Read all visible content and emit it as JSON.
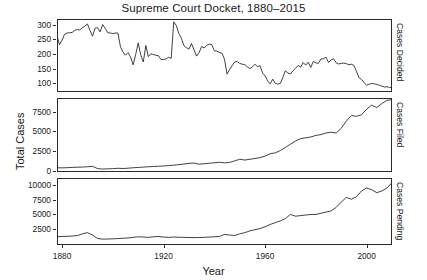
{
  "chart_data": {
    "type": "line",
    "title": "Supreme Court Docket, 1880–2015",
    "xlabel": "Year",
    "ylabel": "Total Cases",
    "grid": false,
    "legend": "none",
    "xlim": [
      1878,
      2010
    ],
    "xticks": [
      1880,
      1920,
      1960,
      2000
    ],
    "xtick_labels": [
      "1880",
      "1920",
      "1960",
      "2000"
    ],
    "panels": [
      {
        "name": "Cases Decided",
        "right_label": "Cases Decided",
        "ylim": [
          70,
          320
        ],
        "yticks": [
          100,
          150,
          200,
          250,
          300
        ],
        "ytick_labels": [
          "100",
          "150",
          "200",
          "250",
          "300"
        ],
        "x": [
          1878,
          1879,
          1880,
          1881,
          1882,
          1883,
          1884,
          1885,
          1886,
          1887,
          1888,
          1889,
          1890,
          1891,
          1892,
          1893,
          1894,
          1895,
          1896,
          1897,
          1898,
          1899,
          1900,
          1901,
          1902,
          1903,
          1904,
          1905,
          1906,
          1907,
          1908,
          1909,
          1910,
          1911,
          1912,
          1913,
          1914,
          1915,
          1916,
          1917,
          1918,
          1919,
          1920,
          1921,
          1922,
          1923,
          1924,
          1925,
          1926,
          1927,
          1928,
          1929,
          1930,
          1931,
          1932,
          1933,
          1934,
          1935,
          1936,
          1937,
          1938,
          1939,
          1940,
          1941,
          1942,
          1943,
          1944,
          1945,
          1946,
          1947,
          1948,
          1949,
          1950,
          1951,
          1952,
          1953,
          1954,
          1955,
          1956,
          1957,
          1958,
          1959,
          1960,
          1961,
          1962,
          1963,
          1964,
          1965,
          1966,
          1967,
          1968,
          1969,
          1970,
          1971,
          1972,
          1973,
          1974,
          1975,
          1976,
          1977,
          1978,
          1979,
          1980,
          1981,
          1982,
          1983,
          1984,
          1985,
          1986,
          1987,
          1988,
          1989,
          1990,
          1991,
          1992,
          1993,
          1994,
          1995,
          1996,
          1997,
          1998,
          1999,
          2000,
          2001,
          2002,
          2003,
          2004,
          2005,
          2006,
          2007,
          2008,
          2009,
          2010
        ],
        "y": [
          262,
          232,
          248,
          268,
          272,
          273,
          274,
          281,
          284,
          282,
          290,
          296,
          303,
          281,
          261,
          289,
          290,
          276,
          301,
          288,
          273,
          272,
          270,
          272,
          272,
          225,
          207,
          196,
          205,
          190,
          163,
          198,
          238,
          197,
          173,
          229,
          191,
          201,
          198,
          196,
          194,
          181,
          181,
          183,
          189,
          185,
          310,
          298,
          270,
          254,
          229,
          222,
          217,
          236,
          214,
          193,
          205,
          226,
          221,
          230,
          234,
          232,
          211,
          210,
          205,
          203,
          182,
          131,
          147,
          160,
          173,
          174,
          168,
          165,
          164,
          156,
          150,
          156,
          165,
          157,
          160,
          135,
          125,
          108,
          98,
          114,
          100,
          97,
          99,
          120,
          143,
          135,
          132,
          143,
          151,
          161,
          155,
          171,
          162,
          172,
          154,
          175,
          170,
          168,
          183,
          184,
          189,
          171,
          180,
          184,
          170,
          166,
          168,
          169,
          167,
          163,
          165,
          161,
          141,
          119,
          113,
          102,
          93,
          97,
          99,
          98,
          96,
          93,
          90,
          87,
          88,
          86,
          85
        ]
      },
      {
        "name": "Cases Filed",
        "right_label": "Cases Filed",
        "ylim": [
          -100,
          9200
        ],
        "yticks": [
          0,
          2500,
          5000,
          7500
        ],
        "ytick_labels": [
          "0",
          "2500",
          "5000",
          "7500"
        ],
        "x": [
          1878,
          1880,
          1882,
          1884,
          1886,
          1888,
          1890,
          1892,
          1894,
          1896,
          1898,
          1900,
          1902,
          1904,
          1906,
          1908,
          1910,
          1912,
          1914,
          1916,
          1918,
          1920,
          1922,
          1924,
          1926,
          1928,
          1930,
          1932,
          1934,
          1936,
          1938,
          1940,
          1942,
          1944,
          1946,
          1948,
          1950,
          1952,
          1954,
          1956,
          1958,
          1960,
          1962,
          1964,
          1966,
          1968,
          1970,
          1972,
          1974,
          1976,
          1978,
          1980,
          1982,
          1984,
          1986,
          1988,
          1990,
          1992,
          1994,
          1996,
          1998,
          2000,
          2002,
          2004,
          2006,
          2008,
          2010
        ],
        "y": [
          430,
          420,
          440,
          480,
          500,
          520,
          560,
          620,
          330,
          270,
          300,
          320,
          370,
          340,
          380,
          430,
          470,
          520,
          560,
          590,
          620,
          660,
          700,
          760,
          820,
          900,
          980,
          1030,
          880,
          940,
          1000,
          1060,
          1120,
          1050,
          1100,
          1300,
          1500,
          1400,
          1500,
          1600,
          1700,
          1900,
          2200,
          2300,
          2600,
          3000,
          3400,
          3800,
          4100,
          4200,
          4300,
          4500,
          4600,
          4800,
          4900,
          4800,
          5400,
          6300,
          7000,
          6900,
          7100,
          7800,
          8300,
          8000,
          8500,
          8900,
          9000
        ]
      },
      {
        "name": "Cases Pending",
        "right_label": "Cases Pending",
        "ylim": [
          -200,
          11200
        ],
        "yticks": [
          2500,
          5000,
          7500,
          10000
        ],
        "ytick_labels": [
          "2500",
          "5000",
          "7500",
          "10000"
        ],
        "x": [
          1878,
          1880,
          1882,
          1884,
          1886,
          1888,
          1890,
          1892,
          1894,
          1896,
          1898,
          1900,
          1902,
          1904,
          1906,
          1908,
          1910,
          1912,
          1914,
          1916,
          1918,
          1920,
          1922,
          1924,
          1926,
          1928,
          1930,
          1932,
          1934,
          1936,
          1938,
          1940,
          1942,
          1944,
          1946,
          1948,
          1950,
          1952,
          1954,
          1956,
          1958,
          1960,
          1962,
          1964,
          1966,
          1968,
          1970,
          1972,
          1974,
          1976,
          1978,
          1980,
          1982,
          1984,
          1986,
          1988,
          1990,
          1992,
          1994,
          1996,
          1998,
          2000,
          2002,
          2004,
          2006,
          2008,
          2010
        ],
        "y": [
          1200,
          1250,
          1280,
          1320,
          1400,
          1700,
          1900,
          1500,
          900,
          800,
          820,
          850,
          900,
          950,
          1000,
          1100,
          1200,
          1150,
          1100,
          1200,
          1250,
          1150,
          1100,
          1150,
          1120,
          1100,
          1080,
          1050,
          1080,
          1100,
          1150,
          1200,
          1250,
          1600,
          1500,
          1400,
          1700,
          1900,
          2200,
          2400,
          2600,
          2900,
          3300,
          3600,
          3900,
          4300,
          5000,
          4700,
          4800,
          4900,
          5000,
          5000,
          5200,
          5400,
          5600,
          6200,
          7100,
          7900,
          7600,
          8000,
          9000,
          9500,
          9200,
          8700,
          9000,
          9500,
          10400
        ]
      }
    ]
  }
}
